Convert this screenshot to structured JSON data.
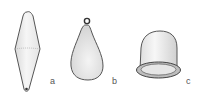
{
  "figure": {
    "items": [
      {
        "id": "a",
        "label": "a",
        "shape": "double-cone spindle sinker"
      },
      {
        "id": "b",
        "label": "b",
        "shape": "pear-shaped sinker with eyelet ring"
      },
      {
        "id": "c",
        "label": "c",
        "shape": "bell / cup-shaped sinker with rim"
      }
    ]
  },
  "colors": {
    "outline": "#555555",
    "fill": "#f0f0f0",
    "shade": "#d8d8d8",
    "background": "#ffffff"
  }
}
